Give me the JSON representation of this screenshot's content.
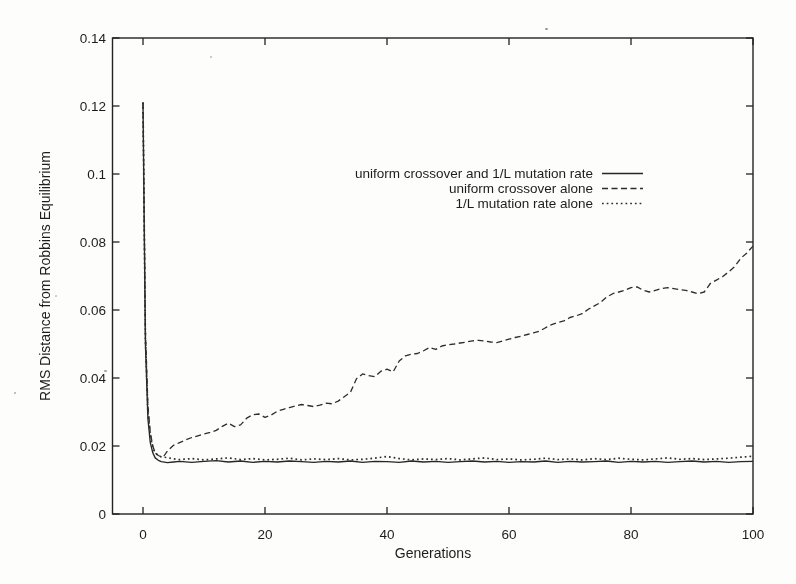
{
  "colors": {
    "ink": "#222222",
    "background": "#ffffff"
  },
  "chart_data": {
    "type": "line",
    "title": "",
    "xlabel": "Generations",
    "ylabel": "RMS Distance from Robbins Equilibrium",
    "xlim": [
      -5,
      100
    ],
    "ylim": [
      0,
      0.14
    ],
    "xticks": [
      0,
      20,
      40,
      60,
      80,
      100
    ],
    "yticks": [
      0,
      0.02,
      0.04,
      0.06,
      0.08,
      0.1,
      0.12,
      0.14
    ],
    "ytick_labels": [
      "0",
      "0.02",
      "0.04",
      "0.06",
      "0.08",
      "0.1",
      "0.12",
      "0.14"
    ],
    "grid": false,
    "legend_position": "inside upper-center",
    "series": [
      {
        "name": "uniform crossover and 1/L mutation rate",
        "style": "solid",
        "points": [
          [
            0,
            0.121
          ],
          [
            0.4,
            0.05
          ],
          [
            0.8,
            0.028
          ],
          [
            1.2,
            0.021
          ],
          [
            1.6,
            0.018
          ],
          [
            2,
            0.0165
          ],
          [
            2.5,
            0.0158
          ],
          [
            3,
            0.0154
          ],
          [
            4,
            0.0151
          ],
          [
            5,
            0.0153
          ],
          [
            6,
            0.0155
          ],
          [
            8,
            0.0152
          ],
          [
            10,
            0.0155
          ],
          [
            12,
            0.0157
          ],
          [
            14,
            0.0153
          ],
          [
            16,
            0.0156
          ],
          [
            18,
            0.0152
          ],
          [
            20,
            0.0155
          ],
          [
            22,
            0.0153
          ],
          [
            24,
            0.0156
          ],
          [
            26,
            0.0154
          ],
          [
            28,
            0.0152
          ],
          [
            30,
            0.0155
          ],
          [
            32,
            0.0153
          ],
          [
            34,
            0.0156
          ],
          [
            36,
            0.0152
          ],
          [
            38,
            0.0155
          ],
          [
            40,
            0.0154
          ],
          [
            42,
            0.0152
          ],
          [
            44,
            0.0156
          ],
          [
            46,
            0.0153
          ],
          [
            48,
            0.0155
          ],
          [
            50,
            0.0152
          ],
          [
            52,
            0.0154
          ],
          [
            54,
            0.0156
          ],
          [
            56,
            0.0153
          ],
          [
            58,
            0.0155
          ],
          [
            60,
            0.0152
          ],
          [
            62,
            0.0154
          ],
          [
            64,
            0.0153
          ],
          [
            66,
            0.0156
          ],
          [
            68,
            0.0152
          ],
          [
            70,
            0.0155
          ],
          [
            72,
            0.0153
          ],
          [
            74,
            0.0154
          ],
          [
            76,
            0.0156
          ],
          [
            78,
            0.0152
          ],
          [
            80,
            0.0155
          ],
          [
            82,
            0.0153
          ],
          [
            84,
            0.0155
          ],
          [
            86,
            0.0152
          ],
          [
            88,
            0.0154
          ],
          [
            90,
            0.0156
          ],
          [
            92,
            0.0153
          ],
          [
            94,
            0.0155
          ],
          [
            96,
            0.0152
          ],
          [
            98,
            0.0154
          ],
          [
            100,
            0.0155
          ]
        ]
      },
      {
        "name": "uniform crossover alone",
        "style": "dashed",
        "points": [
          [
            0,
            0.121
          ],
          [
            0.4,
            0.054
          ],
          [
            0.8,
            0.032
          ],
          [
            1.2,
            0.024
          ],
          [
            1.6,
            0.02
          ],
          [
            2,
            0.018
          ],
          [
            2.5,
            0.0172
          ],
          [
            3,
            0.0168
          ],
          [
            3.5,
            0.0172
          ],
          [
            4,
            0.0185
          ],
          [
            5,
            0.0202
          ],
          [
            6,
            0.021
          ],
          [
            7,
            0.0218
          ],
          [
            8,
            0.0225
          ],
          [
            9,
            0.023
          ],
          [
            10,
            0.0235
          ],
          [
            11,
            0.024
          ],
          [
            12,
            0.0246
          ],
          [
            13,
            0.0258
          ],
          [
            14,
            0.0267
          ],
          [
            15,
            0.0257
          ],
          [
            16,
            0.0262
          ],
          [
            17,
            0.0282
          ],
          [
            18,
            0.0292
          ],
          [
            19,
            0.0294
          ],
          [
            20,
            0.0284
          ],
          [
            21,
            0.0291
          ],
          [
            22,
            0.0302
          ],
          [
            23,
            0.0308
          ],
          [
            24,
            0.0313
          ],
          [
            25,
            0.0318
          ],
          [
            26,
            0.0322
          ],
          [
            27,
            0.0319
          ],
          [
            28,
            0.0316
          ],
          [
            29,
            0.032
          ],
          [
            30,
            0.0326
          ],
          [
            31,
            0.0324
          ],
          [
            32,
            0.0332
          ],
          [
            33,
            0.0345
          ],
          [
            34,
            0.0358
          ],
          [
            35,
            0.0398
          ],
          [
            36,
            0.0412
          ],
          [
            37,
            0.0407
          ],
          [
            38,
            0.0404
          ],
          [
            39,
            0.042
          ],
          [
            40,
            0.0426
          ],
          [
            41,
            0.0418
          ],
          [
            42,
            0.045
          ],
          [
            43,
            0.0465
          ],
          [
            44,
            0.047
          ],
          [
            45,
            0.0472
          ],
          [
            46,
            0.048
          ],
          [
            47,
            0.049
          ],
          [
            48,
            0.0484
          ],
          [
            49,
            0.0494
          ],
          [
            50,
            0.0498
          ],
          [
            51,
            0.05
          ],
          [
            52,
            0.0503
          ],
          [
            53,
            0.0506
          ],
          [
            54,
            0.0509
          ],
          [
            55,
            0.0511
          ],
          [
            56,
            0.0509
          ],
          [
            57,
            0.0506
          ],
          [
            58,
            0.0504
          ],
          [
            59,
            0.0509
          ],
          [
            60,
            0.0514
          ],
          [
            61,
            0.0519
          ],
          [
            62,
            0.0523
          ],
          [
            63,
            0.0528
          ],
          [
            64,
            0.0533
          ],
          [
            65,
            0.0538
          ],
          [
            66,
            0.0548
          ],
          [
            67,
            0.0557
          ],
          [
            68,
            0.0563
          ],
          [
            69,
            0.0568
          ],
          [
            70,
            0.0578
          ],
          [
            71,
            0.0583
          ],
          [
            72,
            0.0589
          ],
          [
            73,
            0.0602
          ],
          [
            74,
            0.0612
          ],
          [
            75,
            0.0622
          ],
          [
            76,
            0.0638
          ],
          [
            77,
            0.0648
          ],
          [
            78,
            0.0653
          ],
          [
            79,
            0.0658
          ],
          [
            80,
            0.0666
          ],
          [
            81,
            0.0668
          ],
          [
            82,
            0.0658
          ],
          [
            83,
            0.0653
          ],
          [
            84,
            0.0658
          ],
          [
            85,
            0.0663
          ],
          [
            86,
            0.0666
          ],
          [
            87,
            0.0663
          ],
          [
            88,
            0.066
          ],
          [
            89,
            0.0658
          ],
          [
            90,
            0.0653
          ],
          [
            91,
            0.0648
          ],
          [
            92,
            0.0653
          ],
          [
            93,
            0.0678
          ],
          [
            94,
            0.0688
          ],
          [
            95,
            0.0698
          ],
          [
            96,
            0.0712
          ],
          [
            97,
            0.0728
          ],
          [
            98,
            0.0752
          ],
          [
            99,
            0.0768
          ],
          [
            100,
            0.0788
          ]
        ]
      },
      {
        "name": "1/L mutation rate alone",
        "style": "dotted",
        "points": [
          [
            0,
            0.121
          ],
          [
            0.4,
            0.052
          ],
          [
            0.8,
            0.03
          ],
          [
            1.2,
            0.023
          ],
          [
            1.6,
            0.0195
          ],
          [
            2,
            0.018
          ],
          [
            2.5,
            0.0172
          ],
          [
            3,
            0.0168
          ],
          [
            4,
            0.0166
          ],
          [
            5,
            0.0162
          ],
          [
            6,
            0.016
          ],
          [
            8,
            0.0163
          ],
          [
            10,
            0.0159
          ],
          [
            12,
            0.0162
          ],
          [
            14,
            0.0165
          ],
          [
            16,
            0.016
          ],
          [
            18,
            0.0163
          ],
          [
            20,
            0.0159
          ],
          [
            22,
            0.0161
          ],
          [
            24,
            0.0164
          ],
          [
            26,
            0.0159
          ],
          [
            28,
            0.0162
          ],
          [
            30,
            0.016
          ],
          [
            32,
            0.0163
          ],
          [
            34,
            0.0159
          ],
          [
            36,
            0.0161
          ],
          [
            38,
            0.0164
          ],
          [
            40,
            0.0169
          ],
          [
            42,
            0.0163
          ],
          [
            44,
            0.0159
          ],
          [
            46,
            0.0162
          ],
          [
            48,
            0.016
          ],
          [
            50,
            0.0163
          ],
          [
            52,
            0.0159
          ],
          [
            54,
            0.0162
          ],
          [
            56,
            0.0165
          ],
          [
            58,
            0.016
          ],
          [
            60,
            0.0162
          ],
          [
            62,
            0.0159
          ],
          [
            64,
            0.0161
          ],
          [
            66,
            0.0164
          ],
          [
            68,
            0.016
          ],
          [
            70,
            0.0162
          ],
          [
            72,
            0.0159
          ],
          [
            74,
            0.0163
          ],
          [
            76,
            0.016
          ],
          [
            78,
            0.0164
          ],
          [
            80,
            0.0161
          ],
          [
            82,
            0.0159
          ],
          [
            84,
            0.0162
          ],
          [
            86,
            0.0165
          ],
          [
            88,
            0.0161
          ],
          [
            90,
            0.0163
          ],
          [
            92,
            0.016
          ],
          [
            94,
            0.0162
          ],
          [
            96,
            0.0164
          ],
          [
            98,
            0.0167
          ],
          [
            100,
            0.017
          ]
        ]
      }
    ]
  }
}
